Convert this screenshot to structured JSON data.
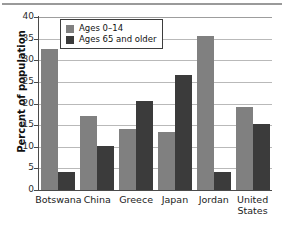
{
  "chart_data": {
    "type": "bar",
    "title": "",
    "subtitle": "",
    "xlabel": "",
    "ylabel": "Percent of population",
    "ylim": [
      0,
      40
    ],
    "yticks": [
      0,
      5,
      10,
      15,
      20,
      25,
      30,
      35,
      40
    ],
    "ytick_labels": [
      "0",
      "5",
      "10",
      "15",
      "20",
      "25",
      "30",
      "35",
      "40"
    ],
    "grid": true,
    "legend_position": "upper-left-inside",
    "categories": [
      "Botswana",
      "China",
      "Greece",
      "Japan",
      "Jordan",
      "United States"
    ],
    "series": [
      {
        "name": "Ages 0–14",
        "color": "#808080",
        "values": [
          32.6,
          17.0,
          14.2,
          13.3,
          35.6,
          19.2
        ]
      },
      {
        "name": "Ages 65 and older",
        "color": "#3b3b3b",
        "values": [
          4.2,
          10.1,
          20.5,
          26.7,
          4.2,
          15.2
        ]
      }
    ]
  },
  "legend": {
    "items": [
      {
        "label": "Ages 0–14",
        "color": "#808080"
      },
      {
        "label": "Ages 65 and older",
        "color": "#3b3b3b"
      }
    ]
  },
  "axes": {
    "y_title": "Percent of population",
    "y_labels": [
      "40",
      "35",
      "30",
      "25",
      "20",
      "15",
      "10",
      "5",
      "0"
    ],
    "x_labels": [
      {
        "line1": "Botswana",
        "line2": ""
      },
      {
        "line1": "China",
        "line2": ""
      },
      {
        "line1": "Greece",
        "line2": ""
      },
      {
        "line1": "Japan",
        "line2": ""
      },
      {
        "line1": "Jordan",
        "line2": ""
      },
      {
        "line1": "United",
        "line2": "States"
      }
    ]
  },
  "colors": {
    "young_bar": "#808080",
    "old_bar": "#3b3b3b",
    "gridline": "#b9b9b9",
    "axis": "#4a4a4a",
    "background": "#ffffff"
  }
}
